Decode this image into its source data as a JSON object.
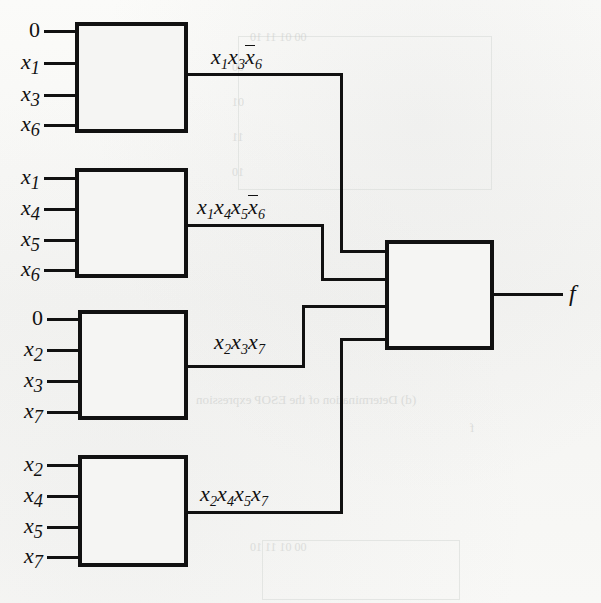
{
  "figure": {
    "output_label": "f",
    "ink_color": "#111111",
    "paper_color": "#f7f7f5"
  },
  "gates": [
    {
      "id": "and-gate-1",
      "inputs": [
        "0",
        "x1",
        "x3",
        "x6"
      ],
      "input_labels": [
        {
          "base": "0",
          "sub": "",
          "overbar": false
        },
        {
          "base": "x",
          "sub": "1",
          "overbar": false
        },
        {
          "base": "x",
          "sub": "3",
          "overbar": false
        },
        {
          "base": "x",
          "sub": "6",
          "overbar": false
        }
      ],
      "output_term": "x1 x3 x6'",
      "output_term_literals": [
        {
          "base": "x",
          "sub": "1",
          "overbar": false
        },
        {
          "base": "x",
          "sub": "3",
          "overbar": false
        },
        {
          "base": "x",
          "sub": "6",
          "overbar": true
        }
      ]
    },
    {
      "id": "and-gate-2",
      "inputs": [
        "x1",
        "x4",
        "x5",
        "x6"
      ],
      "input_labels": [
        {
          "base": "x",
          "sub": "1",
          "overbar": false
        },
        {
          "base": "x",
          "sub": "4",
          "overbar": false
        },
        {
          "base": "x",
          "sub": "5",
          "overbar": false
        },
        {
          "base": "x",
          "sub": "6",
          "overbar": false
        }
      ],
      "output_term": "x1 x4 x5 x6'",
      "output_term_literals": [
        {
          "base": "x",
          "sub": "1",
          "overbar": false
        },
        {
          "base": "x",
          "sub": "4",
          "overbar": false
        },
        {
          "base": "x",
          "sub": "5",
          "overbar": false
        },
        {
          "base": "x",
          "sub": "6",
          "overbar": true
        }
      ]
    },
    {
      "id": "and-gate-3",
      "inputs": [
        "0",
        "x2",
        "x3",
        "x7"
      ],
      "input_labels": [
        {
          "base": "0",
          "sub": "",
          "overbar": false
        },
        {
          "base": "x",
          "sub": "2",
          "overbar": false
        },
        {
          "base": "x",
          "sub": "3",
          "overbar": false
        },
        {
          "base": "x",
          "sub": "7",
          "overbar": false
        }
      ],
      "output_term": "x2 x3 x7",
      "output_term_literals": [
        {
          "base": "x",
          "sub": "2",
          "overbar": false
        },
        {
          "base": "x",
          "sub": "3",
          "overbar": false
        },
        {
          "base": "x",
          "sub": "7",
          "overbar": false
        }
      ]
    },
    {
      "id": "and-gate-4",
      "inputs": [
        "x2",
        "x4",
        "x5",
        "x7"
      ],
      "input_labels": [
        {
          "base": "x",
          "sub": "2",
          "overbar": false
        },
        {
          "base": "x",
          "sub": "4",
          "overbar": false
        },
        {
          "base": "x",
          "sub": "5",
          "overbar": false
        },
        {
          "base": "x",
          "sub": "7",
          "overbar": false
        }
      ],
      "output_term": "x2 x4 x5 x7",
      "output_term_literals": [
        {
          "base": "x",
          "sub": "2",
          "overbar": false
        },
        {
          "base": "x",
          "sub": "4",
          "overbar": false
        },
        {
          "base": "x",
          "sub": "5",
          "overbar": false
        },
        {
          "base": "x",
          "sub": "7",
          "overbar": false
        }
      ]
    }
  ],
  "or_gate": {
    "id": "or-gate",
    "input_count": 4,
    "output_label": "f"
  },
  "input_labels_flat": {
    "g1_i1": "0",
    "g1_i2": "x",
    "g1_i2s": "1",
    "g1_i3": "x",
    "g1_i3s": "3",
    "g1_i4": "x",
    "g1_i4s": "6",
    "g2_i1": "x",
    "g2_i1s": "1",
    "g2_i2": "x",
    "g2_i2s": "4",
    "g2_i3": "x",
    "g2_i3s": "5",
    "g2_i4": "x",
    "g2_i4s": "6",
    "g3_i1": "0",
    "g3_i2": "x",
    "g3_i2s": "2",
    "g3_i3": "x",
    "g3_i3s": "3",
    "g3_i4": "x",
    "g3_i4s": "7",
    "g4_i1": "x",
    "g4_i1s": "2",
    "g4_i2": "x",
    "g4_i2s": "4",
    "g4_i3": "x",
    "g4_i3s": "5",
    "g4_i4": "x",
    "g4_i4s": "7"
  },
  "term_labels_flat": {
    "t1_a": "x",
    "t1_as": "1",
    "t1_b": "x",
    "t1_bs": "3",
    "t1_c": "x",
    "t1_cs": "6",
    "t2_a": "x",
    "t2_as": "1",
    "t2_b": "x",
    "t2_bs": "4",
    "t2_c": "x",
    "t2_cs": "5",
    "t2_d": "x",
    "t2_ds": "6",
    "t3_a": "x",
    "t3_as": "2",
    "t3_b": "x",
    "t3_bs": "3",
    "t3_c": "x",
    "t3_cs": "7",
    "t4_a": "x",
    "t4_as": "2",
    "t4_b": "x",
    "t4_bs": "4",
    "t4_c": "x",
    "t4_cs": "5",
    "t4_d": "x",
    "t4_ds": "7"
  },
  "bleed_through": {
    "note": "faint mirrored text from reverse page",
    "items": [
      {
        "text": "(d) Determination of the ESOP expression",
        "x": 196,
        "y": 392,
        "size": 13
      },
      {
        "text": "00   01   11   10",
        "x": 250,
        "y": 30,
        "size": 12
      },
      {
        "text": "00",
        "x": 232,
        "y": 60,
        "size": 12
      },
      {
        "text": "01",
        "x": 232,
        "y": 95,
        "size": 12
      },
      {
        "text": "11",
        "x": 232,
        "y": 130,
        "size": 12
      },
      {
        "text": "10",
        "x": 232,
        "y": 165,
        "size": 12
      },
      {
        "text": "00   01   11   10",
        "x": 250,
        "y": 540,
        "size": 12
      },
      {
        "text": "1",
        "x": 300,
        "y": 575,
        "size": 12
      },
      {
        "text": "1",
        "x": 345,
        "y": 575,
        "size": 12
      },
      {
        "text": "f",
        "x": 470,
        "y": 420,
        "size": 13
      }
    ]
  }
}
